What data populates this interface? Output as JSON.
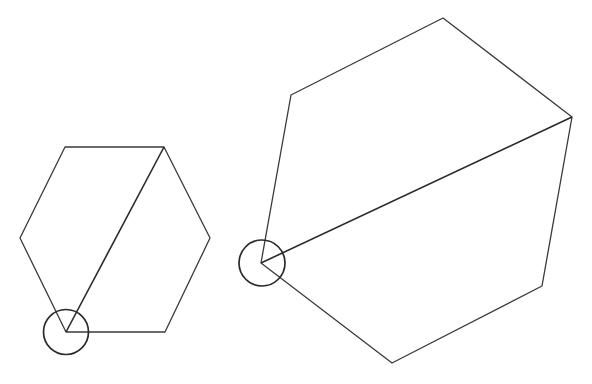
{
  "diagram": {
    "title": "",
    "stroke_color": "#3a3a3a",
    "stroke_width": 1.3,
    "background": "#ffffff",
    "figures": [
      {
        "name": "small-hexagon",
        "vertices": [
          [
            65,
            147
          ],
          [
            164,
            147
          ],
          [
            210,
            238
          ],
          [
            165,
            332
          ],
          [
            66,
            332
          ],
          [
            20,
            238
          ]
        ],
        "diagonal": [
          [
            66,
            332
          ],
          [
            164,
            147
          ]
        ],
        "pivot_circle": {
          "cx": 66,
          "cy": 332,
          "r": 22.5
        }
      },
      {
        "name": "large-rotated-hexagon",
        "vertices": [
          [
            443,
            18
          ],
          [
            572,
            117
          ],
          [
            542,
            286
          ],
          [
            392,
            363
          ],
          [
            261,
            263
          ],
          [
            291,
            95
          ]
        ],
        "diagonal": [
          [
            261,
            263
          ],
          [
            572,
            117
          ]
        ],
        "pivot_circle": {
          "cx": 262,
          "cy": 263,
          "r": 23
        }
      }
    ]
  }
}
